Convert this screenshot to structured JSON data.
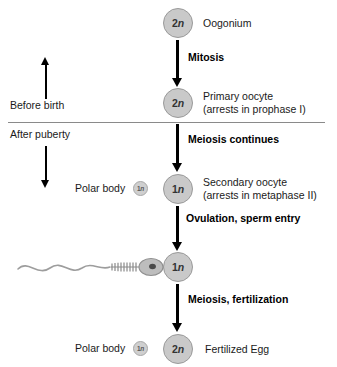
{
  "diagram": {
    "colors": {
      "cell_fill": "#c9c9c9",
      "cell_border": "#9a9a9a",
      "arrow": "#000000",
      "divider": "#8a8a8a",
      "text": "#1a1a1a",
      "background": "#ffffff"
    },
    "timeline": {
      "before_birth_label": "Before birth",
      "after_puberty_label": "After puberty",
      "up_arrow_icon": "arrow-up-icon",
      "down_arrow_icon": "arrow-down-icon"
    },
    "stages": [
      {
        "id": "oogonium",
        "ploidy": "2n",
        "label": "Oogonium",
        "sublabel": ""
      },
      {
        "id": "primary-oocyte",
        "ploidy": "2n",
        "label": "Primary oocyte",
        "sublabel": "(arrests in prophase I)"
      },
      {
        "id": "secondary-oocyte",
        "ploidy": "1n",
        "label": "Secondary oocyte",
        "sublabel": "(arrests in metaphase II)"
      },
      {
        "id": "ovum",
        "ploidy": "1n",
        "label": "",
        "sublabel": ""
      },
      {
        "id": "fertilized-egg",
        "ploidy": "2n",
        "label": "Fertilized Egg",
        "sublabel": ""
      }
    ],
    "transitions": [
      {
        "id": "mitosis",
        "label": "Mitosis"
      },
      {
        "id": "meiosis-continues",
        "label": "Meiosis continues"
      },
      {
        "id": "ovulation",
        "label": "Ovulation, sperm entry"
      },
      {
        "id": "meiosis-fertilization",
        "label": "Meiosis, fertilization"
      }
    ],
    "polar_bodies": [
      {
        "id": "polar-body-1",
        "label": "Polar body",
        "ploidy": "1n"
      },
      {
        "id": "polar-body-2",
        "label": "Polar body",
        "ploidy": "1n"
      }
    ],
    "sperm": {
      "icon": "sperm-icon",
      "label": ""
    }
  }
}
